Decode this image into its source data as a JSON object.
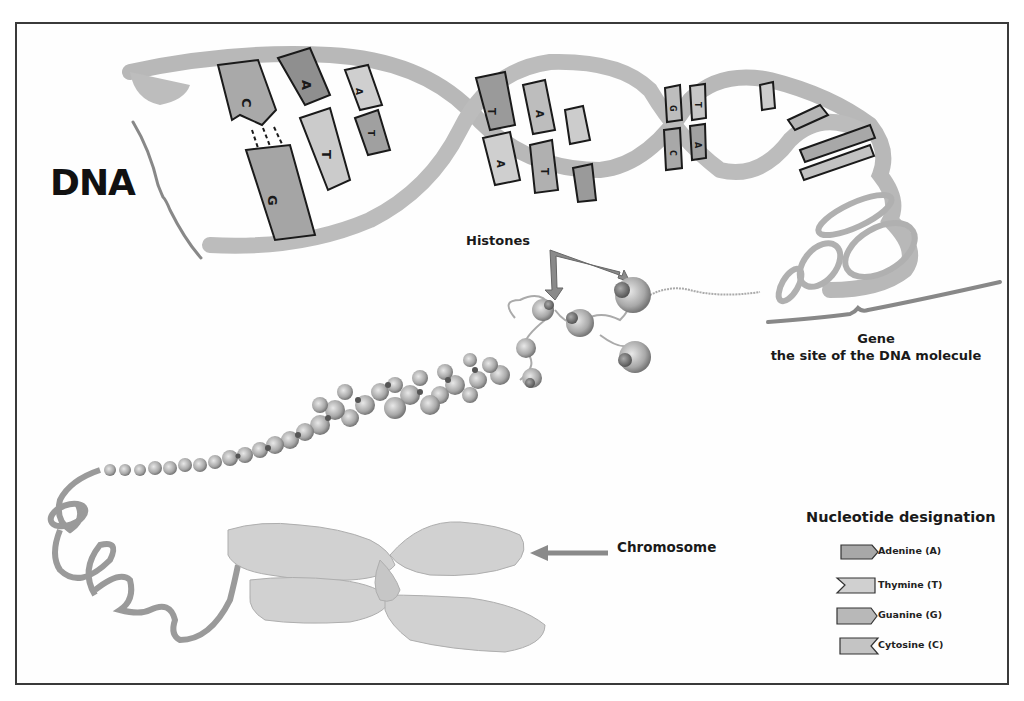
{
  "figure": {
    "title": "DNA",
    "labels": {
      "histones": "Histones",
      "gene_title": "Gene",
      "gene_subtitle": "the site of the DNA molecule",
      "chromosome": "Chromosome"
    },
    "base_letters": [
      "C",
      "G",
      "A",
      "T",
      "A",
      "T",
      "T",
      "A",
      "A",
      "T",
      "G",
      "C",
      "T",
      "A"
    ],
    "legend": {
      "title": "Nucleotide designation",
      "items": [
        {
          "label": "Adenine (A)",
          "shape": "pentagon-right",
          "color": "#a8a8a8"
        },
        {
          "label": "Thymine (T)",
          "shape": "notch-left",
          "color": "#d0d0d0"
        },
        {
          "label": "Guanine (G)",
          "shape": "pentagon-right",
          "color": "#b8b8b8"
        },
        {
          "label": "Cytosine (C)",
          "shape": "notch-right",
          "color": "#c4c4c4"
        }
      ]
    },
    "colors": {
      "backbone": "#b5b5b5",
      "base_dark": "#9e9e9e",
      "base_light": "#d2d2d2",
      "chromosome": "#cfcfcf",
      "frame": "#3a3a3a",
      "text": "#1a1a1a"
    }
  }
}
